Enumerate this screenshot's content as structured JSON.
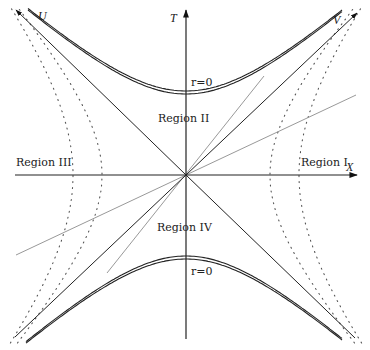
{
  "diagram": {
    "origin": [
      186,
      175
    ],
    "axes": {
      "T": {
        "label": "T",
        "from": [
          186,
          339
        ],
        "to": [
          186,
          10
        ],
        "label_pos": [
          170,
          22
        ]
      },
      "X": {
        "label": "X",
        "from": [
          15,
          175
        ],
        "to": [
          357,
          175
        ],
        "label_pos": [
          346,
          171
        ]
      },
      "U": {
        "label": "U",
        "from": [
          186,
          175
        ],
        "to": [
          16,
          10
        ],
        "label_pos": [
          38,
          20
        ]
      },
      "V": {
        "label": "V",
        "from": [
          186,
          175
        ],
        "to": [
          357,
          13
        ],
        "label_pos": [
          333,
          24
        ]
      },
      "U_ext": {
        "from": [
          186,
          175
        ],
        "to": [
          355,
          338
        ]
      },
      "V_ext": {
        "from": [
          186,
          175
        ],
        "to": [
          15,
          337
        ]
      }
    },
    "singularities": [
      {
        "label": "r=0",
        "vertex_y_offset": 81,
        "sign": 1,
        "label_pos": [
          191,
          86
        ],
        "x_range": [
          -158,
          157
        ]
      },
      {
        "label": "r=0",
        "vertex_y_offset": 81,
        "sign": -1,
        "label_pos": [
          191,
          275
        ],
        "x_range": [
          -160,
          157
        ]
      }
    ],
    "singularity_slope": 0.91,
    "dotted_hyperbolas": [
      {
        "a": 84,
        "slope": 1.15
      },
      {
        "a": 113,
        "slope": 1.25
      }
    ],
    "gray_lines": [
      {
        "from": [
          107,
          273
        ],
        "to": [
          264,
          76
        ]
      },
      {
        "from": [
          16,
          255
        ],
        "to": [
          356,
          95
        ]
      }
    ],
    "regions": [
      {
        "name": "Region I",
        "pos": [
          301,
          166
        ]
      },
      {
        "name": "Region II",
        "pos": [
          158,
          122
        ]
      },
      {
        "name": "Region III",
        "pos": [
          16,
          166
        ]
      },
      {
        "name": "Region IV",
        "pos": [
          157,
          231
        ]
      }
    ]
  }
}
